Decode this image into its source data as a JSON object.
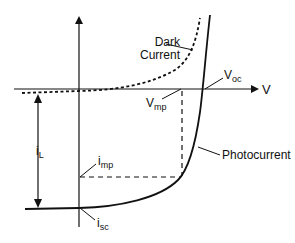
{
  "diagram": {
    "axis_x_label": "V",
    "labels": {
      "dark_current_line1": "Dark",
      "dark_current_line2": "Current",
      "voc_main": "V",
      "voc_sub": "oc",
      "vmp_main": "V",
      "vmp_sub": "mp",
      "photocurrent": "Photocurrent",
      "il_main": "i",
      "il_sub": "L",
      "imp_main": "i",
      "imp_sub": "mp",
      "isc_main": "i",
      "isc_sub": "sc"
    },
    "colors": {
      "line": "#111111",
      "background": "#ffffff"
    }
  }
}
